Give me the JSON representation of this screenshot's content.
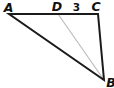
{
  "diagram": {
    "type": "geometry-triangle-with-cevian",
    "points": {
      "A": {
        "label": "A"
      },
      "D": {
        "label": "D"
      },
      "C": {
        "label": "C"
      },
      "B": {
        "label": "B"
      }
    },
    "measurements": {
      "DC": "3"
    },
    "colors": {
      "edge": "#1b1b1b",
      "cevian": "#bdbdbd",
      "label": "#111111",
      "background": "#ffffff"
    }
  }
}
